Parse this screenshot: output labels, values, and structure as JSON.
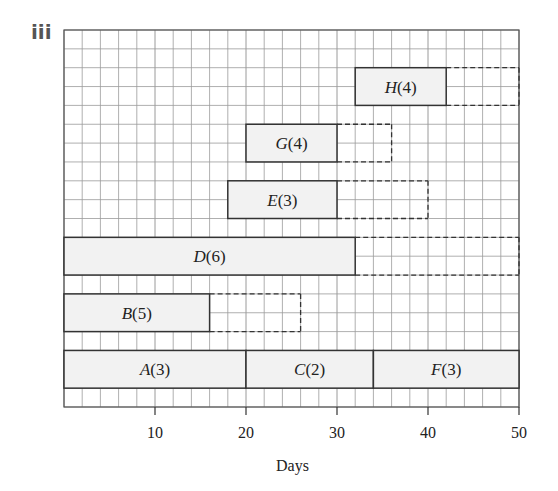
{
  "part_label": "iii",
  "chart_data": {
    "type": "gantt",
    "title": "",
    "xlabel": "Days",
    "xlim": [
      0,
      50
    ],
    "x_ticks": [
      10,
      20,
      30,
      40,
      50
    ],
    "grid": true,
    "grid_minor_step_days": 2,
    "rows_total": 20,
    "colors": {
      "bar_fill": "#f2f2f2",
      "bar_stroke": "#333333",
      "grid": "#9a9a9a"
    },
    "tasks": [
      {
        "label": "A(3)",
        "name": "A",
        "duration": 3,
        "start": 0,
        "end": 20,
        "float_end": null,
        "row": 17
      },
      {
        "label": "C(2)",
        "name": "C",
        "duration": 2,
        "start": 20,
        "end": 34,
        "float_end": null,
        "row": 17
      },
      {
        "label": "F(3)",
        "name": "F",
        "duration": 3,
        "start": 34,
        "end": 50,
        "float_end": null,
        "row": 17
      },
      {
        "label": "B(5)",
        "name": "B",
        "duration": 5,
        "start": 0,
        "end": 16,
        "float_end": 26,
        "row": 14
      },
      {
        "label": "D(6)",
        "name": "D",
        "duration": 6,
        "start": 0,
        "end": 32,
        "float_end": 50,
        "row": 11
      },
      {
        "label": "E(3)",
        "name": "E",
        "duration": 3,
        "start": 18,
        "end": 30,
        "float_end": 40,
        "row": 8
      },
      {
        "label": "G(4)",
        "name": "G",
        "duration": 4,
        "start": 20,
        "end": 30,
        "float_end": 36,
        "row": 5
      },
      {
        "label": "H(4)",
        "name": "H",
        "duration": 4,
        "start": 32,
        "end": 42,
        "float_end": 50,
        "row": 2
      }
    ]
  }
}
